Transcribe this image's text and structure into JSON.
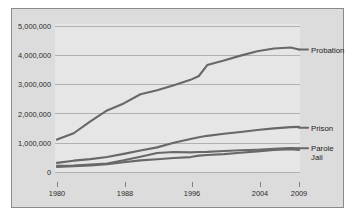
{
  "chart_data": {
    "type": "line",
    "title": "",
    "subtitle": "",
    "xlabel": "",
    "ylabel": "",
    "grid": true,
    "legend_position": "right-inline-labels",
    "x": [
      1980,
      1982,
      1984,
      1986,
      1988,
      1990,
      1992,
      1994,
      1996,
      1997,
      1998,
      2000,
      2002,
      2004,
      2006,
      2008,
      2009
    ],
    "xlim": [
      1980,
      2009
    ],
    "ylim": [
      0,
      5000000
    ],
    "ytick_labels": [
      "0",
      "1,000,000",
      "2,000,000",
      "3,000,000",
      "4,000,000",
      "5,000,000"
    ],
    "ytick_values": [
      0,
      1000000,
      2000000,
      3000000,
      4000000,
      5000000
    ],
    "xtick_labels": [
      "1980",
      "1988",
      "1996",
      "2004",
      "2009"
    ],
    "xtick_values": [
      1980,
      1988,
      1996,
      2004,
      2009
    ],
    "series": [
      {
        "name": "Probation",
        "label": "Probation",
        "color": "#686868",
        "values": [
          1118000,
          1335000,
          1740000,
          2115000,
          2356000,
          2670000,
          2811000,
          2981000,
          3165000,
          3297000,
          3671000,
          3826000,
          3995000,
          4144000,
          4237000,
          4271000,
          4203000
        ]
      },
      {
        "name": "Prison",
        "label": "Prison",
        "color": "#686868",
        "values": [
          320000,
          395000,
          448000,
          523000,
          627000,
          743000,
          851000,
          1012000,
          1138000,
          1197000,
          1246000,
          1316000,
          1380000,
          1445000,
          1502000,
          1545000,
          1555000
        ]
      },
      {
        "name": "Parole",
        "label": "Parole",
        "color": "#686868",
        "values": [
          220000,
          225000,
          266000,
          300000,
          407000,
          531000,
          658000,
          690000,
          679000,
          694000,
          696000,
          724000,
          750000,
          771000,
          799000,
          826000,
          820000
        ]
      },
      {
        "name": "Jail",
        "label": "Jail",
        "color": "#686868",
        "values": [
          182000,
          208000,
          234000,
          274000,
          341000,
          405000,
          444000,
          486000,
          518000,
          567000,
          592000,
          621000,
          665000,
          714000,
          766000,
          785000,
          760000
        ]
      }
    ],
    "colors": {
      "line": "#686868",
      "gridline": "#9a9a9a",
      "plot_background": "#e6e6e6",
      "panel_background": "#dcdcdc",
      "panel_border": "#8a8a8a",
      "text": "#2b2b2b"
    }
  }
}
